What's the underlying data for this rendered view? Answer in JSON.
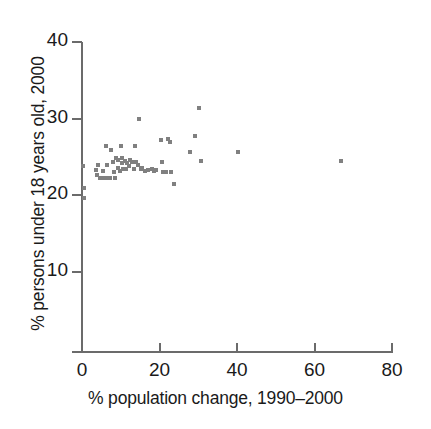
{
  "chart_data": {
    "type": "scatter",
    "title": "",
    "xlabel": "% population change, 1990–2000",
    "ylabel": "% persons under 18 years old, 2000",
    "xlim": [
      0,
      80
    ],
    "ylim": [
      0,
      40
    ],
    "xticks": [
      0,
      20,
      40,
      60,
      80
    ],
    "yticks": [
      10,
      20,
      30,
      40
    ],
    "xtick_labels": [
      "0",
      "20",
      "40",
      "60",
      "80"
    ],
    "ytick_labels": [
      "10",
      "20",
      "30",
      "40"
    ],
    "grid": false,
    "legend": null,
    "marker": "square",
    "marker_color": "#808080",
    "axis_color": "#6b6b6b",
    "points": [
      {
        "x": 0.3,
        "y": 23.8
      },
      {
        "x": 0.4,
        "y": 21.0
      },
      {
        "x": 0.5,
        "y": 19.6
      },
      {
        "x": 3.6,
        "y": 23.3
      },
      {
        "x": 3.8,
        "y": 22.6
      },
      {
        "x": 4.2,
        "y": 23.9
      },
      {
        "x": 4.6,
        "y": 22.3
      },
      {
        "x": 4.8,
        "y": 22.2
      },
      {
        "x": 5.3,
        "y": 23.2
      },
      {
        "x": 5.5,
        "y": 22.2
      },
      {
        "x": 5.9,
        "y": 22.2
      },
      {
        "x": 6.2,
        "y": 26.4
      },
      {
        "x": 6.5,
        "y": 24.0
      },
      {
        "x": 6.8,
        "y": 22.3
      },
      {
        "x": 7.2,
        "y": 22.2
      },
      {
        "x": 7.6,
        "y": 25.9
      },
      {
        "x": 7.9,
        "y": 24.4
      },
      {
        "x": 8.2,
        "y": 23.1
      },
      {
        "x": 8.5,
        "y": 22.3
      },
      {
        "x": 8.8,
        "y": 24.9
      },
      {
        "x": 9.2,
        "y": 24.6
      },
      {
        "x": 9.4,
        "y": 23.6
      },
      {
        "x": 9.7,
        "y": 23.2
      },
      {
        "x": 10.0,
        "y": 26.5
      },
      {
        "x": 10.2,
        "y": 24.9
      },
      {
        "x": 10.4,
        "y": 24.2
      },
      {
        "x": 10.7,
        "y": 23.4
      },
      {
        "x": 11.0,
        "y": 24.5
      },
      {
        "x": 11.3,
        "y": 23.5
      },
      {
        "x": 11.7,
        "y": 24.2
      },
      {
        "x": 12.1,
        "y": 23.8
      },
      {
        "x": 12.5,
        "y": 24.6
      },
      {
        "x": 12.9,
        "y": 24.3
      },
      {
        "x": 13.3,
        "y": 23.5
      },
      {
        "x": 13.7,
        "y": 26.5
      },
      {
        "x": 14.0,
        "y": 24.3
      },
      {
        "x": 14.4,
        "y": 23.9
      },
      {
        "x": 14.8,
        "y": 30.0
      },
      {
        "x": 15.1,
        "y": 23.4
      },
      {
        "x": 15.6,
        "y": 23.6
      },
      {
        "x": 16.3,
        "y": 23.2
      },
      {
        "x": 17.1,
        "y": 23.3
      },
      {
        "x": 18.0,
        "y": 23.4
      },
      {
        "x": 18.6,
        "y": 23.2
      },
      {
        "x": 19.2,
        "y": 23.3
      },
      {
        "x": 20.3,
        "y": 27.2
      },
      {
        "x": 20.6,
        "y": 24.3
      },
      {
        "x": 21.0,
        "y": 23.1
      },
      {
        "x": 21.6,
        "y": 23.0
      },
      {
        "x": 22.3,
        "y": 27.3
      },
      {
        "x": 22.6,
        "y": 26.9
      },
      {
        "x": 23.0,
        "y": 23.1
      },
      {
        "x": 23.8,
        "y": 21.5
      },
      {
        "x": 27.8,
        "y": 25.6
      },
      {
        "x": 29.2,
        "y": 27.7
      },
      {
        "x": 30.2,
        "y": 31.4
      },
      {
        "x": 30.8,
        "y": 24.5
      },
      {
        "x": 40.2,
        "y": 25.6
      },
      {
        "x": 66.9,
        "y": 24.5
      }
    ]
  },
  "geometry": {
    "origin_px": {
      "x": 82,
      "y": 352
    },
    "x_axis_end_px": 392,
    "y_axis_top_px": 42,
    "px_per_x_unit": 3.875,
    "px_per_y_unit": 7.6667
  }
}
